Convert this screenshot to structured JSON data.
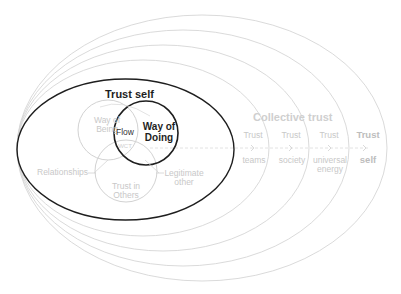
{
  "diagram": {
    "inner_ellipse": {
      "label": "Trust self"
    },
    "venn": {
      "way_of_being": "Way of\nBeing",
      "way_of_doing": "Way of\nDoing",
      "flow": "Flow",
      "center": "WCT",
      "trust_in_others": "Trust in\nOthers"
    },
    "side_labels": {
      "relationships": "Relationships",
      "legitimate_other": "Legitimate\nother"
    },
    "collective": {
      "title": "Collective trust",
      "rings": [
        {
          "top": "Trust",
          "bottom": "teams"
        },
        {
          "top": "Trust",
          "bottom": "society"
        },
        {
          "top": "Trust",
          "bottom": "universal\nenergy"
        },
        {
          "top": "Trust",
          "bottom": "self"
        }
      ]
    },
    "colors": {
      "bold_stroke": "#1e1e1e",
      "faint_stroke": "#d4d4d4",
      "faint_text": "#c8c8c8"
    }
  }
}
